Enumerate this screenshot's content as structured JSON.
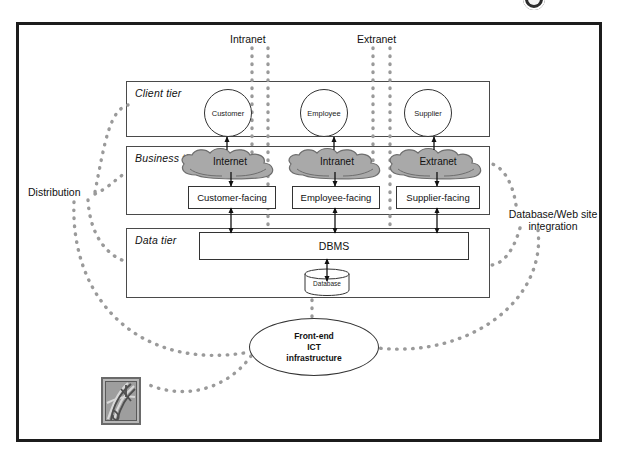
{
  "figure": {
    "title_glyph": "circle-badge-icon",
    "top_labels": [
      {
        "id": "intranet",
        "text": "Intranet"
      },
      {
        "id": "extranet",
        "text": "Extranet"
      }
    ],
    "side_labels": [
      {
        "id": "distribution",
        "text": "Distribution"
      },
      {
        "id": "db-web-integration",
        "text": "Database/Web site integration"
      }
    ],
    "tiers": [
      {
        "id": "client",
        "label": "Client tier"
      },
      {
        "id": "business",
        "label": "Business tier"
      },
      {
        "id": "data",
        "label": "Data tier"
      }
    ],
    "actors": [
      {
        "id": "customer",
        "label": "Customer"
      },
      {
        "id": "employee",
        "label": "Employee"
      },
      {
        "id": "supplier",
        "label": "Supplier"
      }
    ],
    "clouds": [
      {
        "id": "internet",
        "label": "Internet"
      },
      {
        "id": "intranet",
        "label": "Intranet"
      },
      {
        "id": "extranet",
        "label": "Extranet"
      }
    ],
    "facing_components": [
      {
        "id": "customer-facing",
        "label": "Customer-facing"
      },
      {
        "id": "employee-facing",
        "label": "Employee-facing"
      },
      {
        "id": "supplier-facing",
        "label": "Supplier-facing"
      }
    ],
    "data_components": [
      {
        "id": "dbms",
        "label": "DBMS"
      },
      {
        "id": "database",
        "label": "Database"
      }
    ],
    "footer_node": {
      "id": "front-end-ict",
      "line1": "Front-end",
      "line2": "ICT",
      "line3": "infrastructure"
    },
    "colors": {
      "frame": "#1c1c1c",
      "box_stroke": "#333333",
      "tier_stroke": "#4a4a4a",
      "cloud_fill": "#a9a9a9",
      "cloud_stroke": "#6e6e6e",
      "dotted": "#9a9a9a",
      "text": "#111111",
      "page_bg": "#ffffff"
    }
  }
}
